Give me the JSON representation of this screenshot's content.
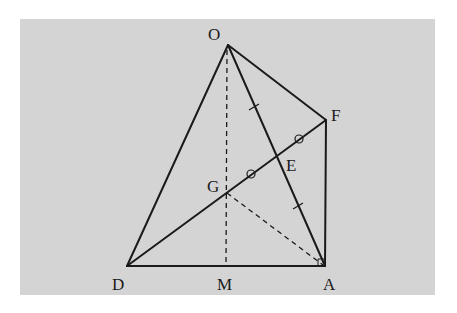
{
  "diagram": {
    "type": "geometry",
    "background_color": "#d4d4d4",
    "line_color": "#1a1a1a",
    "points": {
      "O": {
        "label": "O",
        "x": 228,
        "y": 45,
        "lx": 208,
        "ly": 40
      },
      "F": {
        "label": "F",
        "x": 326,
        "y": 120,
        "lx": 331,
        "ly": 121
      },
      "A": {
        "label": "A",
        "x": 325,
        "y": 266,
        "lx": 323,
        "ly": 290
      },
      "D": {
        "label": "D",
        "x": 127,
        "y": 266,
        "lx": 112,
        "ly": 290
      },
      "M": {
        "label": "M",
        "x": 226,
        "y": 266,
        "lx": 217,
        "ly": 290
      },
      "G": {
        "label": "G",
        "x": 227,
        "y": 193,
        "lx": 207,
        "ly": 192
      },
      "E": {
        "label": "E",
        "x": 277,
        "y": 155,
        "lx": 286,
        "ly": 171
      }
    },
    "solid_segments": [
      "OD",
      "OA",
      "OF",
      "FA",
      "DA",
      "DF"
    ],
    "dashed_segments": [
      "OM",
      "GA"
    ],
    "tick_marks": [
      {
        "on": "OE",
        "type": "single-tick",
        "x": 254,
        "y": 107
      },
      {
        "on": "EA",
        "type": "single-tick",
        "x": 298,
        "y": 206
      }
    ],
    "circle_marks": [
      {
        "on": "EF",
        "x": 299,
        "y": 139
      },
      {
        "on": "GE",
        "x": 251,
        "y": 174
      }
    ],
    "right_angle_at": "A"
  }
}
